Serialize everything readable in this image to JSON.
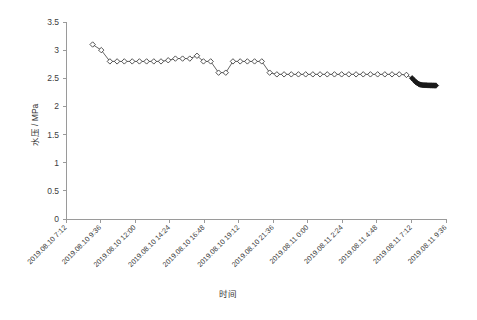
{
  "chart_data": {
    "type": "line",
    "title": "",
    "xlabel": "时间",
    "ylabel": "水压 / MPa",
    "ylim": [
      0,
      3.5
    ],
    "ytick_values": [
      0,
      0.5,
      1,
      1.5,
      2,
      2.5,
      3,
      3.5
    ],
    "ytick_labels": [
      "0",
      "0.5",
      "1",
      "1.5",
      "2",
      "2.5",
      "3",
      "3.5"
    ],
    "xtick_labels": [
      "2019.08.10 7:12",
      "2019.08.10 9:36",
      "2019.08.10 12:00",
      "2019.08.10 14:24",
      "2019.08.10 16:48",
      "2019.08.10 19:12",
      "2019.08.10 21:36",
      "2019.08.11 0:00",
      "2019.08.11 2:24",
      "2019.08.11 4:48",
      "2019.08.11 7:12",
      "2019.08.11 9:36"
    ],
    "xtick_hours": [
      0,
      2.4,
      4.8,
      7.2,
      9.6,
      12,
      14.4,
      16.8,
      19.2,
      21.6,
      24,
      26.4
    ],
    "xlim_hours": [
      0,
      26.4
    ],
    "grid": false,
    "legend": null,
    "marker": "diamond-open",
    "series": [
      {
        "name": "水压",
        "x_hours": [
          1.85,
          2.45,
          3.05,
          3.55,
          4.05,
          4.6,
          5.1,
          5.6,
          6.1,
          6.6,
          7.1,
          7.6,
          8.1,
          8.6,
          9.1,
          9.55,
          10.05,
          10.6,
          11.1,
          11.6,
          12.1,
          12.6,
          13.1,
          13.6,
          14.15,
          14.65,
          15.15,
          15.65,
          16.15,
          16.65,
          17.15,
          17.65,
          18.15,
          18.65,
          19.15,
          19.65,
          20.15,
          20.65,
          21.15,
          21.65,
          22.15,
          22.65,
          23.15,
          23.65,
          24.05,
          24.2,
          24.32,
          24.42,
          24.5,
          24.58,
          24.66,
          24.74,
          24.82,
          24.9,
          24.98,
          25.06,
          25.14,
          25.22,
          25.3,
          25.38,
          25.46,
          25.54,
          25.62,
          25.7
        ],
        "y_values": [
          3.1,
          3.0,
          2.8,
          2.8,
          2.8,
          2.8,
          2.8,
          2.8,
          2.8,
          2.8,
          2.82,
          2.85,
          2.85,
          2.85,
          2.9,
          2.8,
          2.8,
          2.6,
          2.6,
          2.8,
          2.8,
          2.8,
          2.8,
          2.8,
          2.6,
          2.57,
          2.57,
          2.57,
          2.57,
          2.57,
          2.57,
          2.57,
          2.57,
          2.57,
          2.57,
          2.57,
          2.57,
          2.57,
          2.57,
          2.57,
          2.57,
          2.57,
          2.57,
          2.56,
          2.5,
          2.46,
          2.43,
          2.41,
          2.4,
          2.39,
          2.385,
          2.38,
          2.378,
          2.376,
          2.375,
          2.375,
          2.374,
          2.374,
          2.373,
          2.373,
          2.372,
          2.372,
          2.371,
          2.371
        ],
        "dense_from_index": 44
      }
    ]
  }
}
